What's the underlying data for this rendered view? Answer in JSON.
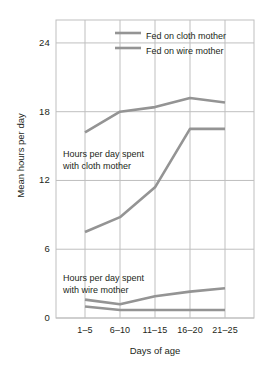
{
  "chart_data": {
    "type": "line",
    "title": "",
    "xlabel": "Days of age",
    "ylabel": "Mean hours per day",
    "categories": [
      "1–5",
      "6–10",
      "11–15",
      "16–20",
      "21–25"
    ],
    "ylim": [
      0,
      26
    ],
    "yticks": [
      0,
      6,
      12,
      18,
      24
    ],
    "ytick_labels": [
      "0",
      "6",
      "12",
      "18",
      "24"
    ],
    "grid": true,
    "legend_position": "top-right",
    "series": [
      {
        "name": "Fed on cloth mother",
        "group": "Hours per day spent with cloth mother",
        "values": [
          16.2,
          18.0,
          18.4,
          19.2,
          18.8
        ]
      },
      {
        "name": "Fed on wire mother",
        "group": "Hours per day spent with cloth mother",
        "values": [
          7.5,
          8.8,
          11.4,
          16.5,
          16.5
        ]
      },
      {
        "name": "Fed on cloth mother",
        "group": "Hours per day spent with wire mother",
        "values": [
          1.0,
          0.7,
          0.7,
          0.7,
          0.7
        ]
      },
      {
        "name": "Fed on wire mother",
        "group": "Hours per day spent with wire mother",
        "values": [
          1.6,
          1.2,
          1.9,
          2.3,
          2.6
        ]
      }
    ],
    "annotations": [
      {
        "id": "cloth",
        "line1": "Hours per day spent",
        "line2": "with cloth mother"
      },
      {
        "id": "wire",
        "line1": "Hours per day spent",
        "line2": "with wire mother"
      }
    ],
    "colors": {
      "line": "#949494",
      "grid": "#bfbfbf",
      "axis": "#9a9a9a",
      "text": "#231f20",
      "background": "#ffffff"
    }
  },
  "legend": {
    "items": [
      {
        "label": "Fed on cloth mother"
      },
      {
        "label": "Fed on wire mother"
      }
    ]
  },
  "axes": {
    "y": {
      "label": "Mean hours per day",
      "ticks": [
        "0",
        "6",
        "12",
        "18",
        "24"
      ]
    },
    "x": {
      "label": "Days of age",
      "ticks": [
        "1–5",
        "6–10",
        "11–15",
        "16–20",
        "21–25"
      ]
    }
  },
  "annotations": {
    "cloth_line1": "Hours per day spent",
    "cloth_line2": "with cloth mother",
    "wire_line1": "Hours per day spent",
    "wire_line2": "with wire mother"
  }
}
